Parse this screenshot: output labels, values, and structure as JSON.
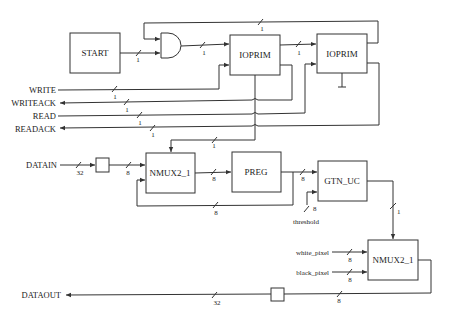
{
  "diagram": {
    "type": "block-diagram",
    "blocks": {
      "start": {
        "label": "START"
      },
      "ioprim1": {
        "label": "IOPRIM"
      },
      "ioprim2": {
        "label": "IOPRIM"
      },
      "nmux_top": {
        "label": "NMUX2_1"
      },
      "preg": {
        "label": "PREG"
      },
      "gtn_uc": {
        "label": "GTN_UC"
      },
      "nmux_bottom": {
        "label": "NMUX2_1"
      }
    },
    "ports": {
      "write": "WRITE",
      "writeack": "WRITEACK",
      "read": "READ",
      "readack": "READACK",
      "datain": "DATAIN",
      "dataout": "DATAOUT",
      "threshold": "threshold",
      "white_pixel": "white_pixel",
      "black_pixel": "black_pixel"
    },
    "bus_widths": {
      "start_out": "1",
      "and_out": "1",
      "top_feedback": "1",
      "ioprim_link": "1",
      "write": "1",
      "writeack": "1",
      "read": "1",
      "readack": "1",
      "select_top": "1",
      "datain": "32",
      "datain_reg": "8",
      "nmux_to_preg": "8",
      "preg_to_gtn": "8",
      "preg_feedback": "8",
      "threshold": "8",
      "gtn_out": "1",
      "white_pixel": "8",
      "black_pixel": "8",
      "nmux_out": "8",
      "dataout": "32"
    }
  }
}
